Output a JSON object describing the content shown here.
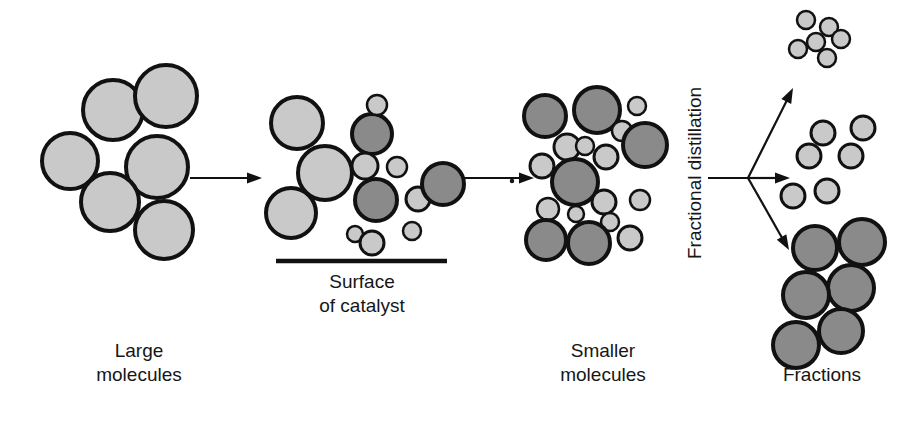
{
  "diagram": {
    "type": "process-flow",
    "width": 900,
    "height": 434,
    "background": "#ffffff",
    "colors": {
      "light_molecule_fill": "#c9c9c9",
      "dark_molecule_fill": "#8a8a8a",
      "outline": "#111111",
      "text": "#161616"
    }
  },
  "labels": {
    "stage1_line1": "Large",
    "stage1_line2": "molecules",
    "catalyst_line1": "Surface",
    "catalyst_line2": "of catalyst",
    "stage3_line1": "Smaller",
    "stage3_line2": "molecules",
    "fractional_distillation": "Fractional distillation",
    "fractions": "Fractions"
  },
  "stages": [
    {
      "name": "large-molecules",
      "label": "Large molecules",
      "molecule_count": 6,
      "molecules": [
        {
          "cx": 70,
          "cy": 161,
          "r": 28,
          "shade": "light"
        },
        {
          "cx": 113,
          "cy": 110,
          "r": 30,
          "shade": "light"
        },
        {
          "cx": 166,
          "cy": 96,
          "r": 31,
          "shade": "light"
        },
        {
          "cx": 157,
          "cy": 167,
          "r": 31,
          "shade": "light"
        },
        {
          "cx": 110,
          "cy": 202,
          "r": 29,
          "shade": "light"
        },
        {
          "cx": 164,
          "cy": 230,
          "r": 29,
          "shade": "light"
        }
      ]
    },
    {
      "name": "catalyst-surface",
      "label": "Surface of catalyst",
      "molecule_count": 13,
      "molecules": [
        {
          "cx": 297,
          "cy": 123,
          "r": 26,
          "shade": "light"
        },
        {
          "cx": 325,
          "cy": 173,
          "r": 27,
          "shade": "light"
        },
        {
          "cx": 291,
          "cy": 213,
          "r": 25,
          "shade": "light"
        },
        {
          "cx": 376,
          "cy": 200,
          "r": 21,
          "shade": "dark"
        },
        {
          "cx": 372,
          "cy": 134,
          "r": 20,
          "shade": "dark"
        },
        {
          "cx": 377,
          "cy": 105,
          "r": 10,
          "shade": "light"
        },
        {
          "cx": 365,
          "cy": 166,
          "r": 13,
          "shade": "light"
        },
        {
          "cx": 397,
          "cy": 167,
          "r": 10,
          "shade": "light"
        },
        {
          "cx": 418,
          "cy": 199,
          "r": 12,
          "shade": "light"
        },
        {
          "cx": 412,
          "cy": 231,
          "r": 9,
          "shade": "light"
        },
        {
          "cx": 443,
          "cy": 184,
          "r": 21,
          "shade": "dark"
        },
        {
          "cx": 355,
          "cy": 234,
          "r": 8,
          "shade": "light"
        },
        {
          "cx": 372,
          "cy": 243,
          "r": 12,
          "shade": "light"
        }
      ],
      "surface_line": {
        "x1": 276,
        "y1": 261,
        "x2": 447,
        "y2": 261
      }
    },
    {
      "name": "smaller-molecules",
      "label": "Smaller molecules",
      "molecule_count": 19,
      "molecules": [
        {
          "cx": 545,
          "cy": 116,
          "r": 21,
          "shade": "dark"
        },
        {
          "cx": 597,
          "cy": 110,
          "r": 23,
          "shade": "dark"
        },
        {
          "cx": 567,
          "cy": 147,
          "r": 13,
          "shade": "light"
        },
        {
          "cx": 637,
          "cy": 106,
          "r": 9,
          "shade": "light"
        },
        {
          "cx": 622,
          "cy": 131,
          "r": 10,
          "shade": "light"
        },
        {
          "cx": 585,
          "cy": 146,
          "r": 9,
          "shade": "light"
        },
        {
          "cx": 645,
          "cy": 145,
          "r": 22,
          "shade": "dark"
        },
        {
          "cx": 606,
          "cy": 157,
          "r": 12,
          "shade": "light"
        },
        {
          "cx": 542,
          "cy": 166,
          "r": 12,
          "shade": "light"
        },
        {
          "cx": 575,
          "cy": 182,
          "r": 23,
          "shade": "dark"
        },
        {
          "cx": 604,
          "cy": 202,
          "r": 12,
          "shade": "light"
        },
        {
          "cx": 640,
          "cy": 200,
          "r": 10,
          "shade": "light"
        },
        {
          "cx": 548,
          "cy": 209,
          "r": 11,
          "shade": "light"
        },
        {
          "cx": 576,
          "cy": 214,
          "r": 8,
          "shade": "light"
        },
        {
          "cx": 610,
          "cy": 222,
          "r": 9,
          "shade": "light"
        },
        {
          "cx": 546,
          "cy": 240,
          "r": 20,
          "shade": "dark"
        },
        {
          "cx": 589,
          "cy": 243,
          "r": 21,
          "shade": "dark"
        },
        {
          "cx": 630,
          "cy": 238,
          "r": 12,
          "shade": "light"
        },
        {
          "cx": 512,
          "cy": 181,
          "r": 1,
          "shade": "light"
        }
      ]
    },
    {
      "name": "fractions",
      "label": "Fractions",
      "groups": [
        {
          "name": "light-fraction",
          "molecule_count": 6,
          "molecules": [
            {
              "cx": 806,
              "cy": 20,
              "r": 9,
              "shade": "light"
            },
            {
              "cx": 829,
              "cy": 27,
              "r": 9,
              "shade": "light"
            },
            {
              "cx": 816,
              "cy": 42,
              "r": 9,
              "shade": "light"
            },
            {
              "cx": 841,
              "cy": 39,
              "r": 9,
              "shade": "light"
            },
            {
              "cx": 798,
              "cy": 49,
              "r": 9,
              "shade": "light"
            },
            {
              "cx": 827,
              "cy": 58,
              "r": 9,
              "shade": "light"
            }
          ]
        },
        {
          "name": "middle-fraction",
          "molecule_count": 6,
          "molecules": [
            {
              "cx": 823,
              "cy": 133,
              "r": 12,
              "shade": "light"
            },
            {
              "cx": 863,
              "cy": 128,
              "r": 12,
              "shade": "light"
            },
            {
              "cx": 809,
              "cy": 156,
              "r": 12,
              "shade": "light"
            },
            {
              "cx": 851,
              "cy": 156,
              "r": 12,
              "shade": "light"
            },
            {
              "cx": 827,
              "cy": 191,
              "r": 12,
              "shade": "light"
            },
            {
              "cx": 793,
              "cy": 196,
              "r": 12,
              "shade": "light"
            }
          ]
        },
        {
          "name": "heavy-fraction",
          "molecule_count": 6,
          "molecules": [
            {
              "cx": 815,
              "cy": 248,
              "r": 22,
              "shade": "dark"
            },
            {
              "cx": 862,
              "cy": 242,
              "r": 23,
              "shade": "dark"
            },
            {
              "cx": 851,
              "cy": 288,
              "r": 23,
              "shade": "dark"
            },
            {
              "cx": 806,
              "cy": 295,
              "r": 23,
              "shade": "dark"
            },
            {
              "cx": 841,
              "cy": 331,
              "r": 22,
              "shade": "dark"
            },
            {
              "cx": 796,
              "cy": 345,
              "r": 23,
              "shade": "dark"
            }
          ]
        }
      ]
    }
  ],
  "arrows": [
    {
      "name": "arrow-stage1-to-stage2",
      "x1": 190,
      "y1": 178,
      "x2": 262,
      "y2": 178,
      "direction": "right"
    },
    {
      "name": "arrow-stage2-to-stage3",
      "x1": 462,
      "y1": 178,
      "x2": 534,
      "y2": 178,
      "direction": "right"
    },
    {
      "name": "arrow-distillation-stem",
      "x1": 708,
      "y1": 178,
      "x2": 748,
      "y2": 178,
      "direction": "none"
    },
    {
      "name": "arrow-branch-up",
      "x1": 748,
      "y1": 178,
      "x2": 793,
      "y2": 88,
      "direction": "up-right"
    },
    {
      "name": "arrow-branch-middle",
      "x1": 748,
      "y1": 178,
      "x2": 790,
      "y2": 178,
      "direction": "right"
    },
    {
      "name": "arrow-branch-down",
      "x1": 748,
      "y1": 178,
      "x2": 789,
      "y2": 250,
      "direction": "down-right"
    }
  ]
}
